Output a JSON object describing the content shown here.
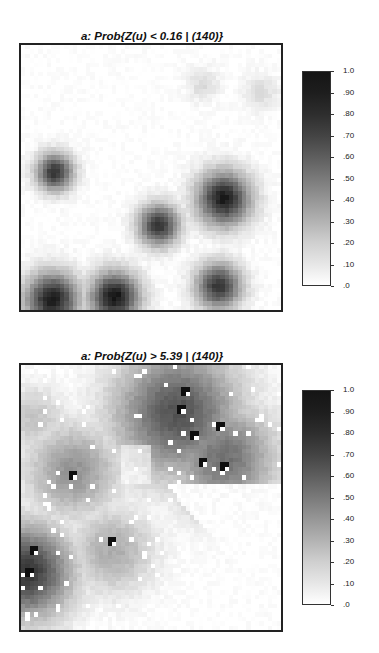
{
  "chart_data": [
    {
      "type": "heatmap",
      "title": "a: Prob{Z(u) < 0.16 | (140)}",
      "colorbar": {
        "min": 0.0,
        "max": 1.0,
        "ticks": [
          "1.0",
          ".90",
          ".80",
          ".70",
          ".60",
          ".50",
          ".40",
          ".30",
          ".20",
          ".10",
          ".0"
        ]
      },
      "grid": false,
      "blobs": [
        {
          "x": 0.13,
          "y": 0.48,
          "r": 0.09,
          "p": 0.85
        },
        {
          "x": 0.53,
          "y": 0.68,
          "r": 0.1,
          "p": 0.85
        },
        {
          "x": 0.78,
          "y": 0.58,
          "r": 0.13,
          "p": 0.95
        },
        {
          "x": 0.76,
          "y": 0.91,
          "r": 0.11,
          "p": 0.85
        },
        {
          "x": 0.12,
          "y": 0.96,
          "r": 0.13,
          "p": 0.95
        },
        {
          "x": 0.36,
          "y": 0.95,
          "r": 0.12,
          "p": 0.98
        },
        {
          "x": 0.7,
          "y": 0.15,
          "r": 0.08,
          "p": 0.15
        },
        {
          "x": 0.92,
          "y": 0.18,
          "r": 0.09,
          "p": 0.15
        }
      ]
    },
    {
      "type": "heatmap",
      "title": "a: Prob{Z(u) > 5.39 | (140)}",
      "colorbar": {
        "min": 0.0,
        "max": 1.0,
        "ticks": [
          "1.0",
          ".90",
          ".80",
          ".70",
          ".60",
          ".50",
          ".40",
          ".30",
          ".20",
          ".10",
          ".0"
        ]
      },
      "grid": false,
      "blobs": [
        {
          "x": 0.6,
          "y": 0.18,
          "r": 0.3,
          "p": 0.72
        },
        {
          "x": 0.78,
          "y": 0.35,
          "r": 0.25,
          "p": 0.6
        },
        {
          "x": 0.2,
          "y": 0.4,
          "r": 0.22,
          "p": 0.45
        },
        {
          "x": 0.35,
          "y": 0.7,
          "r": 0.2,
          "p": 0.35
        },
        {
          "x": 0.02,
          "y": 0.78,
          "r": 0.22,
          "p": 0.85
        },
        {
          "x": 0.05,
          "y": 0.2,
          "r": 0.15,
          "p": 0.25
        }
      ],
      "hard_data_high": [
        [
          0.62,
          0.09
        ],
        [
          0.6,
          0.15
        ],
        [
          0.66,
          0.25
        ],
        [
          0.75,
          0.23
        ],
        [
          0.69,
          0.36
        ],
        [
          0.78,
          0.37
        ],
        [
          0.19,
          0.41
        ],
        [
          0.34,
          0.66
        ],
        [
          0.04,
          0.69
        ],
        [
          0.03,
          0.78
        ]
      ],
      "hard_data_low_count": 120
    }
  ]
}
